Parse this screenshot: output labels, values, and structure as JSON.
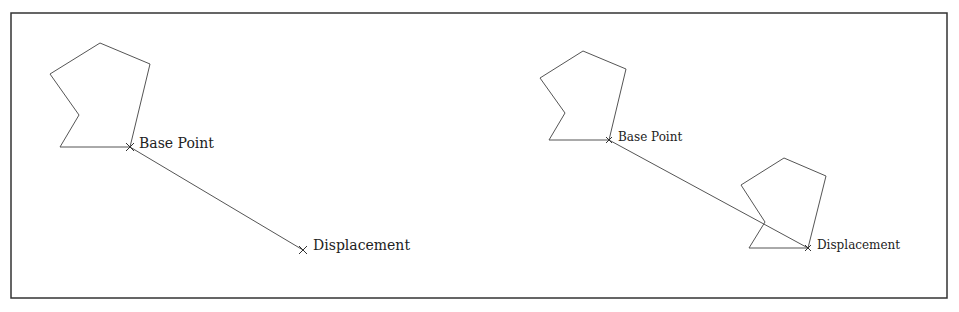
{
  "figure": {
    "frame": {
      "x": 11,
      "y": 13,
      "width": 936,
      "height": 285,
      "stroke": "#333333"
    },
    "line_color": "#555555",
    "left_panel": {
      "polygon": [
        [
          100,
          43
        ],
        [
          150,
          64
        ],
        [
          130,
          147
        ],
        [
          60,
          147
        ],
        [
          79,
          115
        ],
        [
          50,
          74
        ]
      ],
      "base_point": {
        "x": 130,
        "y": 147,
        "label": "Base Point"
      },
      "displacement": {
        "x": 303,
        "y": 250,
        "label": "Displacement"
      }
    },
    "right_panel": {
      "polygon": [
        [
          583,
          51
        ],
        [
          626,
          69
        ],
        [
          609,
          140
        ],
        [
          549,
          140
        ],
        [
          565,
          113
        ],
        [
          540,
          78
        ]
      ],
      "moved_polygon": [
        [
          784,
          158
        ],
        [
          826,
          176
        ],
        [
          808,
          248
        ],
        [
          749,
          248
        ],
        [
          765,
          222
        ],
        [
          741,
          185
        ]
      ],
      "base_point": {
        "x": 609,
        "y": 140,
        "label": "Base Point"
      },
      "displacement": {
        "x": 808,
        "y": 248,
        "label": "Displacement"
      }
    }
  }
}
